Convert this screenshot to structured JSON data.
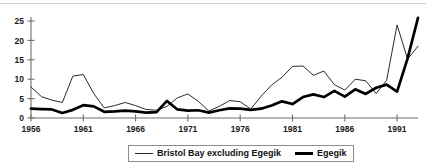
{
  "chart_data": {
    "type": "line",
    "title": "",
    "subtitle": "",
    "xlabel": "",
    "ylabel": "",
    "xlim": [
      1956,
      1993
    ],
    "ylim": [
      0,
      25
    ],
    "yticks": [
      0,
      5,
      10,
      15,
      20,
      25
    ],
    "xticks": [
      1956,
      1961,
      1966,
      1971,
      1976,
      1981,
      1986,
      1991
    ],
    "xtick_labels": [
      "1956",
      "1961",
      "1966",
      "1971",
      "1976",
      "1981",
      "1986",
      "1991"
    ],
    "ytick_labels": [
      "0",
      "5",
      "10",
      "15",
      "20",
      "25"
    ],
    "grid": false,
    "legend_position": "bottom-center",
    "x": [
      1956,
      1957,
      1958,
      1959,
      1960,
      1961,
      1962,
      1963,
      1964,
      1965,
      1966,
      1967,
      1968,
      1969,
      1970,
      1971,
      1972,
      1973,
      1974,
      1975,
      1976,
      1977,
      1978,
      1979,
      1980,
      1981,
      1982,
      1983,
      1984,
      1985,
      1986,
      1987,
      1988,
      1989,
      1990,
      1991,
      1992,
      1993
    ],
    "series": [
      {
        "name": "Bristol Bay excluding Egegik",
        "style": "thin",
        "color": "#2b2b2b",
        "values": [
          8.0,
          5.5,
          4.6,
          4.0,
          10.8,
          11.2,
          6.3,
          2.6,
          3.2,
          4.0,
          3.2,
          2.2,
          2.0,
          3.0,
          5.2,
          6.2,
          4.3,
          1.8,
          3.0,
          4.5,
          4.2,
          2.3,
          5.6,
          8.5,
          10.5,
          13.3,
          13.4,
          11.0,
          12.1,
          8.6,
          7.2,
          10.0,
          9.6,
          6.3,
          9.7,
          24.0,
          15.2,
          18.5
        ]
      },
      {
        "name": "Egegik",
        "style": "thick",
        "color": "#000000",
        "values": [
          2.4,
          2.3,
          2.2,
          1.3,
          2.1,
          3.3,
          3.0,
          1.6,
          1.7,
          1.9,
          1.7,
          1.4,
          1.5,
          4.4,
          2.2,
          1.9,
          2.0,
          1.4,
          2.0,
          2.5,
          2.4,
          2.1,
          2.4,
          3.2,
          4.3,
          3.6,
          5.4,
          6.1,
          5.4,
          7.0,
          5.5,
          7.4,
          6.2,
          7.8,
          8.6,
          6.8,
          15.3,
          25.8
        ]
      }
    ]
  },
  "legend": {
    "items": [
      {
        "label": "Bristol Bay excluding Egegik",
        "style": "thin"
      },
      {
        "label": "Egegik",
        "style": "thick"
      }
    ]
  }
}
